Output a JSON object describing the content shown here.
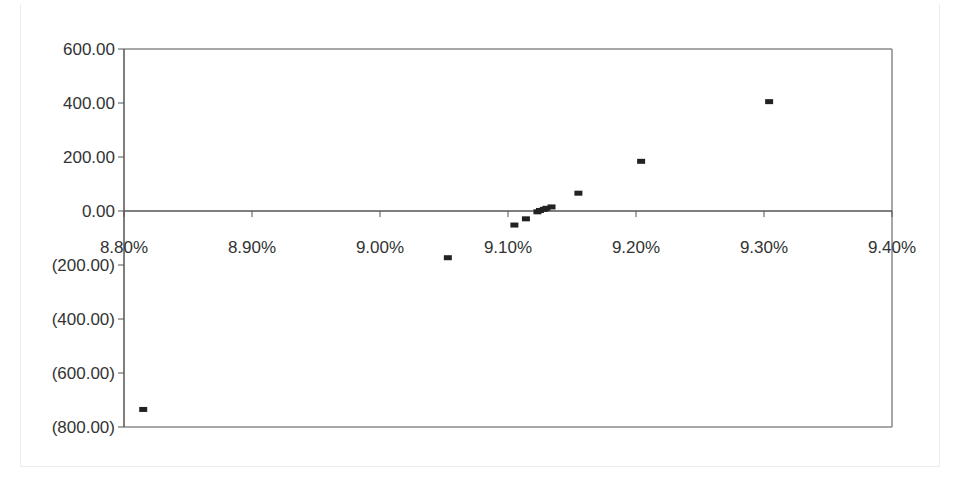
{
  "chart_data": {
    "type": "scatter",
    "title": "",
    "xlabel": "",
    "ylabel": "",
    "xlim": [
      8.8,
      9.4
    ],
    "ylim": [
      -800,
      600
    ],
    "grid": false,
    "legend": null,
    "x_tick_labels": [
      "8.80%",
      "8.90%",
      "9.00%",
      "9.10%",
      "9.20%",
      "9.30%",
      "9.40%"
    ],
    "x_ticks": [
      8.8,
      8.9,
      9.0,
      9.1,
      9.2,
      9.3,
      9.4
    ],
    "y_tick_labels": [
      "600.00",
      "400.00",
      "200.00",
      "0.00",
      "(200.00)",
      "(400.00)",
      "(600.00)",
      "(800.00)"
    ],
    "y_ticks": [
      600,
      400,
      200,
      0,
      -200,
      -400,
      -600,
      -800
    ],
    "series": [
      {
        "name": "Series 1",
        "marker": "square",
        "color": "#222222",
        "points": [
          {
            "x": 8.815,
            "y": -735
          },
          {
            "x": 9.053,
            "y": -173
          },
          {
            "x": 9.105,
            "y": -52
          },
          {
            "x": 9.114,
            "y": -29
          },
          {
            "x": 9.123,
            "y": -3
          },
          {
            "x": 9.125,
            "y": 2
          },
          {
            "x": 9.128,
            "y": 6
          },
          {
            "x": 9.13,
            "y": 10
          },
          {
            "x": 9.134,
            "y": 15
          },
          {
            "x": 9.155,
            "y": 66
          },
          {
            "x": 9.204,
            "y": 184
          },
          {
            "x": 9.304,
            "y": 405
          }
        ]
      }
    ]
  },
  "colors": {
    "axis": "#555555",
    "frame_top_right": "#8a8a8a",
    "marker": "#222222",
    "text": "#333333"
  }
}
